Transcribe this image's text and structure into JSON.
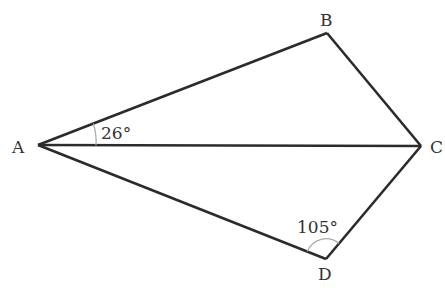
{
  "diagram": {
    "type": "quadrilateral-kite",
    "vertices": {
      "A": {
        "label": "A"
      },
      "B": {
        "label": "B"
      },
      "C": {
        "label": "C"
      },
      "D": {
        "label": "D"
      }
    },
    "segments": [
      "AB",
      "BC",
      "CD",
      "DA",
      "AC"
    ],
    "angles": [
      {
        "name": "angle-BAC",
        "vertex": "A",
        "label": "26°",
        "degrees": 26
      },
      {
        "name": "angle-ADC",
        "vertex": "D",
        "label": "105°",
        "degrees": 105
      }
    ],
    "colors": {
      "line": "#2b2b2b",
      "arc": "#aaaaaa",
      "text": "#333333"
    }
  }
}
